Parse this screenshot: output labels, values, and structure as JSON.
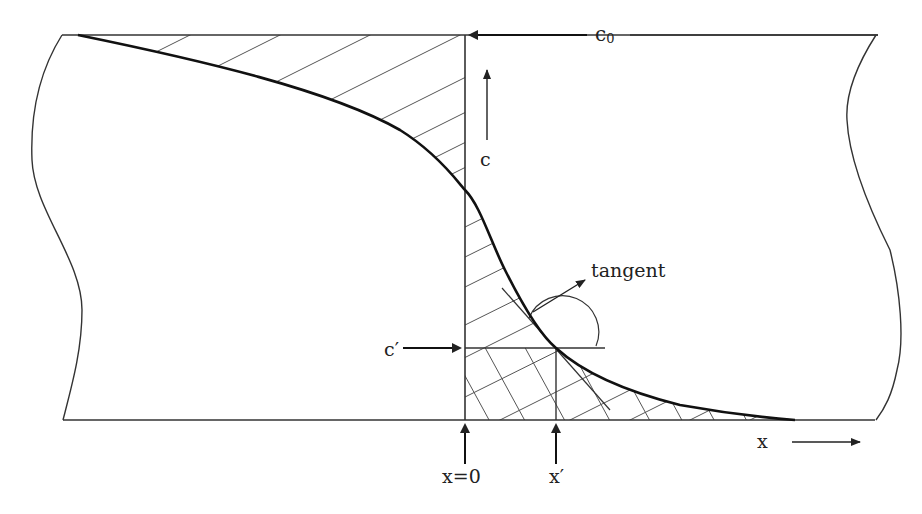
{
  "diagram": {
    "labels": {
      "c0": "c",
      "c0_sub": "0",
      "c_axis": "c",
      "c_prime": "c′",
      "tangent": "tangent",
      "x_zero": "x=0",
      "x_prime": "x′",
      "x_axis": "x"
    },
    "colors": {
      "stroke": "#222222",
      "hatch": "#555555",
      "background": "#ffffff"
    },
    "regions": [
      {
        "name": "single-hatched-region",
        "description": "Area between curve and c0 line left of x=0, and under curve above c′ right of x=0"
      },
      {
        "name": "cross-hatched-region",
        "description": "Area under curve below c′ right of x=0"
      }
    ]
  }
}
